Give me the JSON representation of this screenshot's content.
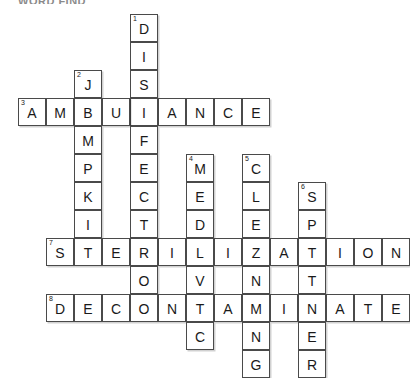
{
  "page": {
    "title_partial": "WORD FIND",
    "background": "#ffffff",
    "ink_color": "#1a1a1a",
    "cell_border_color": "#4a4a4a"
  },
  "puzzle": {
    "type": "crossword-grid",
    "cell_size_px": 28,
    "origin": {
      "x": 18,
      "y": 14
    },
    "columns": 12,
    "rows": 12,
    "entries": [
      {
        "number": 1,
        "direction": "down",
        "answer": "DISINFECTION",
        "length": 12,
        "start_col": 4,
        "start_row": 0
      },
      {
        "number": 2,
        "direction": "down",
        "answer": "JUMPKIT",
        "length": 7,
        "start_col": 2,
        "start_row": 2
      },
      {
        "number": 3,
        "direction": "across",
        "answer": "AMBULANCE",
        "length": 9,
        "start_col": 0,
        "start_row": 3
      },
      {
        "number": 4,
        "direction": "down",
        "answer": "MEDIVAC",
        "length": 7,
        "start_col": 6,
        "start_row": 5
      },
      {
        "number": 5,
        "direction": "down",
        "answer": "CLEANING",
        "length": 8,
        "start_col": 8,
        "start_row": 5
      },
      {
        "number": 6,
        "direction": "down",
        "answer": "SPOTTER",
        "length": 7,
        "start_col": 10,
        "start_row": 6
      },
      {
        "number": 7,
        "direction": "across",
        "answer": "STERILIZATION",
        "length": 13,
        "start_col": 1,
        "start_row": 7
      },
      {
        "number": 8,
        "direction": "across",
        "answer": "DECONTAMINATE",
        "length": 13,
        "start_col": 1,
        "start_row": 9
      }
    ],
    "cells": [
      {
        "col": 4,
        "row": 0,
        "letter": "D",
        "number": 1
      },
      {
        "col": 4,
        "row": 1,
        "letter": "I",
        "number": null
      },
      {
        "col": 4,
        "row": 2,
        "letter": "S",
        "number": null
      },
      {
        "col": 2,
        "row": 2,
        "letter": "J",
        "number": 2
      },
      {
        "col": 4,
        "row": 3,
        "letter": "I",
        "number": null
      },
      {
        "col": 0,
        "row": 3,
        "letter": "A",
        "number": 3
      },
      {
        "col": 1,
        "row": 3,
        "letter": "M",
        "number": null
      },
      {
        "col": 2,
        "row": 3,
        "letter": "B",
        "number": null
      },
      {
        "col": 3,
        "row": 3,
        "letter": "U",
        "number": null
      },
      {
        "col": 4,
        "row": 3,
        "letter": "L",
        "number": null
      },
      {
        "col": 5,
        "row": 3,
        "letter": "A",
        "number": null
      },
      {
        "col": 6,
        "row": 3,
        "letter": "N",
        "number": null
      },
      {
        "col": 7,
        "row": 3,
        "letter": "C",
        "number": null
      },
      {
        "col": 8,
        "row": 3,
        "letter": "E",
        "number": null
      },
      {
        "col": 2,
        "row": 4,
        "letter": "M",
        "number": null
      },
      {
        "col": 4,
        "row": 4,
        "letter": "F",
        "number": null
      },
      {
        "col": 2,
        "row": 5,
        "letter": "P",
        "number": null
      },
      {
        "col": 4,
        "row": 5,
        "letter": "E",
        "number": null
      },
      {
        "col": 6,
        "row": 5,
        "letter": "M",
        "number": 4
      },
      {
        "col": 8,
        "row": 5,
        "letter": "C",
        "number": 5
      },
      {
        "col": 2,
        "row": 6,
        "letter": "K",
        "number": null
      },
      {
        "col": 4,
        "row": 6,
        "letter": "C",
        "number": null
      },
      {
        "col": 6,
        "row": 6,
        "letter": "E",
        "number": null
      },
      {
        "col": 8,
        "row": 6,
        "letter": "L",
        "number": null
      },
      {
        "col": 10,
        "row": 6,
        "letter": "S",
        "number": 6
      },
      {
        "col": 2,
        "row": 7,
        "letter": "I",
        "number": null
      },
      {
        "col": 4,
        "row": 7,
        "letter": "T",
        "number": null
      },
      {
        "col": 6,
        "row": 7,
        "letter": "D",
        "number": null
      },
      {
        "col": 8,
        "row": 7,
        "letter": "E",
        "number": null
      },
      {
        "col": 10,
        "row": 7,
        "letter": "P",
        "number": null
      },
      {
        "col": 1,
        "row": 8,
        "letter": "S",
        "number": 7
      },
      {
        "col": 2,
        "row": 8,
        "letter": "T",
        "number": null
      },
      {
        "col": 3,
        "row": 8,
        "letter": "E",
        "number": null
      },
      {
        "col": 4,
        "row": 8,
        "letter": "R",
        "number": null
      },
      {
        "col": 5,
        "row": 8,
        "letter": "I",
        "number": null
      },
      {
        "col": 6,
        "row": 8,
        "letter": "L",
        "number": null
      },
      {
        "col": 7,
        "row": 8,
        "letter": "I",
        "number": null
      },
      {
        "col": 8,
        "row": 8,
        "letter": "Z",
        "number": null
      },
      {
        "col": 9,
        "row": 8,
        "letter": "A",
        "number": null
      },
      {
        "col": 10,
        "row": 8,
        "letter": "T",
        "number": null
      },
      {
        "col": 11,
        "row": 8,
        "letter": "I",
        "number": null
      },
      {
        "col": 12,
        "row": 8,
        "letter": "O",
        "number": null
      },
      {
        "col": 13,
        "row": 8,
        "letter": "N",
        "number": null
      },
      {
        "col": 4,
        "row": 9,
        "letter": "O",
        "number": null
      },
      {
        "col": 6,
        "row": 9,
        "letter": "V",
        "number": null
      },
      {
        "col": 8,
        "row": 9,
        "letter": "N",
        "number": null
      },
      {
        "col": 10,
        "row": 9,
        "letter": "T",
        "number": null
      },
      {
        "col": 1,
        "row": 10,
        "letter": "D",
        "number": 8
      },
      {
        "col": 2,
        "row": 10,
        "letter": "E",
        "number": null
      },
      {
        "col": 3,
        "row": 10,
        "letter": "C",
        "number": null
      },
      {
        "col": 4,
        "row": 10,
        "letter": "O",
        "number": null
      },
      {
        "col": 5,
        "row": 10,
        "letter": "N",
        "number": null
      },
      {
        "col": 6,
        "row": 10,
        "letter": "T",
        "number": null
      },
      {
        "col": 7,
        "row": 10,
        "letter": "A",
        "number": null
      },
      {
        "col": 8,
        "row": 10,
        "letter": "M",
        "number": null
      },
      {
        "col": 9,
        "row": 10,
        "letter": "I",
        "number": null
      },
      {
        "col": 10,
        "row": 10,
        "letter": "N",
        "number": null
      },
      {
        "col": 11,
        "row": 10,
        "letter": "A",
        "number": null
      },
      {
        "col": 12,
        "row": 10,
        "letter": "T",
        "number": null
      },
      {
        "col": 13,
        "row": 10,
        "letter": "E",
        "number": null
      },
      {
        "col": 6,
        "row": 11,
        "letter": "C",
        "number": null
      },
      {
        "col": 8,
        "row": 11,
        "letter": "N",
        "number": null
      },
      {
        "col": 10,
        "row": 11,
        "letter": "E",
        "number": null
      },
      {
        "col": 8,
        "row": 12,
        "letter": "G",
        "number": null
      },
      {
        "col": 10,
        "row": 12,
        "letter": "R",
        "number": null
      }
    ]
  }
}
